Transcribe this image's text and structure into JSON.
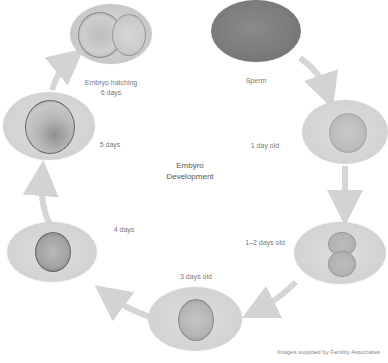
{
  "diagram": {
    "title_line1": "Embyro",
    "title_line2": "Development",
    "credit": "Images supplied by Fertility Associates",
    "colors": {
      "background": "#ffffff",
      "stage_fill": "#d6d6d6",
      "sperm_fill": "#7c7c7c",
      "arrow": "#d3d3d3",
      "label_text": "#777777"
    },
    "stages": [
      {
        "id": "sperm",
        "label_line1": "Sperm",
        "label_line2": ""
      },
      {
        "id": "day1",
        "label_line1": "1 day old",
        "label_line2": ""
      },
      {
        "id": "day1-2",
        "label_line1": "1–2 days old",
        "label_line2": ""
      },
      {
        "id": "day3",
        "label_line1": "3 days old",
        "label_line2": ""
      },
      {
        "id": "day4",
        "label_line1": "4 days",
        "label_line2": ""
      },
      {
        "id": "day5",
        "label_line1": "5 days",
        "label_line2": ""
      },
      {
        "id": "day6",
        "label_line1": "Embryo hatching",
        "label_line2": "6 days"
      }
    ],
    "flow": [
      "Sperm",
      "1 day old",
      "1–2 days old",
      "3 days old",
      "4 days",
      "5 days",
      "Embryo hatching 6 days"
    ]
  }
}
